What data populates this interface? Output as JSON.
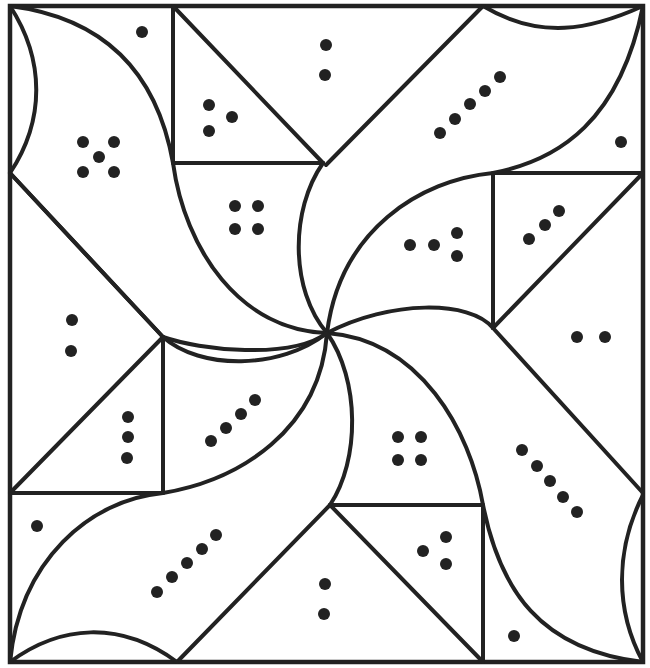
{
  "figure": {
    "type": "dot-count pinwheel puzzle (line art)",
    "width": 650,
    "height": 668,
    "stroke_color": "#222222",
    "background_color": "#ffffff",
    "frame": {
      "x1": 10,
      "y1": 6,
      "x2": 643,
      "y2": 662
    },
    "hub": {
      "x": 327,
      "y": 333
    }
  },
  "straight_lines": [
    {
      "name": "top-left-vertical",
      "x1": 173,
      "y1": 6,
      "x2": 173,
      "y2": 163
    },
    {
      "name": "top-left-horizontal",
      "x1": 173,
      "y1": 163,
      "x2": 323,
      "y2": 163
    },
    {
      "name": "top-diagonal",
      "x1": 173,
      "y1": 6,
      "x2": 323,
      "y2": 163
    },
    {
      "name": "top-right-diagonal",
      "x1": 483,
      "y1": 6,
      "x2": 326,
      "y2": 165
    },
    {
      "name": "right-upper-horizontal",
      "x1": 493,
      "y1": 173,
      "x2": 643,
      "y2": 173
    },
    {
      "name": "right-upper-vertical",
      "x1": 493,
      "y1": 173,
      "x2": 493,
      "y2": 328
    },
    {
      "name": "right-diagonal",
      "x1": 643,
      "y1": 173,
      "x2": 493,
      "y2": 328
    },
    {
      "name": "right-lower-diagonal",
      "x1": 493,
      "y1": 328,
      "x2": 643,
      "y2": 493
    },
    {
      "name": "left-diagonal",
      "x1": 10,
      "y1": 173,
      "x2": 163,
      "y2": 337
    },
    {
      "name": "left-lower-vertical",
      "x1": 163,
      "y1": 337,
      "x2": 163,
      "y2": 493
    },
    {
      "name": "left-lower-horizontal",
      "x1": 10,
      "y1": 493,
      "x2": 163,
      "y2": 493
    },
    {
      "name": "left-lower-diagonal",
      "x1": 10,
      "y1": 493,
      "x2": 163,
      "y2": 337
    },
    {
      "name": "bottom-right-horizontal",
      "x1": 330,
      "y1": 505,
      "x2": 483,
      "y2": 505
    },
    {
      "name": "bottom-right-vertical",
      "x1": 483,
      "y1": 505,
      "x2": 483,
      "y2": 662
    },
    {
      "name": "bottom-right-diagonal",
      "x1": 330,
      "y1": 505,
      "x2": 483,
      "y2": 662
    },
    {
      "name": "bottom-left-diagonal",
      "x1": 177,
      "y1": 662,
      "x2": 330,
      "y2": 505
    }
  ],
  "curves": [
    {
      "name": "top-left-blade-outer",
      "d": "M10,6 C120,20 160,90 173,163 C185,250 240,330 327,333"
    },
    {
      "name": "top-left-lens",
      "d": "M10,6 C45,60 45,120 10,173"
    },
    {
      "name": "top-left-blade-inner",
      "d": "M10,173 L163,337 C200,350 290,360 327,333"
    },
    {
      "name": "top-right-blade-outer",
      "d": "M643,6 C620,120 560,160 493,173 C420,180 340,230 327,333"
    },
    {
      "name": "top-right-lens",
      "d": "M483,6 C540,40 590,30 643,6"
    },
    {
      "name": "top-right-blade-inner",
      "d": "M323,163 C290,210 290,290 327,333"
    },
    {
      "name": "right-blade-outer",
      "d": "M643,662 C540,650 500,590 483,505 C470,430 420,340 327,333"
    },
    {
      "name": "right-lens",
      "d": "M643,495 C615,550 615,610 643,662"
    },
    {
      "name": "right-blade-inner",
      "d": "M327,333 C390,300 470,300 493,328"
    },
    {
      "name": "bottom-left-blade-outer",
      "d": "M10,662 C20,560 90,500 163,493 C240,480 320,430 327,333"
    },
    {
      "name": "bottom-lens",
      "d": "M10,662 C60,625 120,620 177,662"
    },
    {
      "name": "bottom-blade-inner",
      "d": "M327,333 C360,380 360,460 330,505"
    },
    {
      "name": "left-blade-inner",
      "d": "M163,337 C200,370 280,370 327,333"
    }
  ],
  "dot_clusters": [
    {
      "region": "top-left-corner-piece",
      "count": 1,
      "dots": [
        [
          142,
          32
        ]
      ]
    },
    {
      "region": "top-left-blade",
      "count": 5,
      "dots": [
        [
          83,
          142
        ],
        [
          114,
          142
        ],
        [
          99,
          157
        ],
        [
          83,
          172
        ],
        [
          114,
          172
        ]
      ]
    },
    {
      "region": "top-small-triangle",
      "count": 3,
      "dots": [
        [
          209,
          105
        ],
        [
          232,
          117
        ],
        [
          209,
          131
        ]
      ]
    },
    {
      "region": "top-center-triangle",
      "count": 2,
      "dots": [
        [
          326,
          45
        ],
        [
          325,
          75
        ]
      ]
    },
    {
      "region": "top-right-blade",
      "count": 5,
      "dots": [
        [
          440,
          133
        ],
        [
          455,
          119
        ],
        [
          470,
          104
        ],
        [
          485,
          91
        ],
        [
          500,
          77
        ]
      ]
    },
    {
      "region": "top-right-corner-piece",
      "count": 1,
      "dots": [
        [
          621,
          142
        ]
      ]
    },
    {
      "region": "upper-center-piece",
      "count": 4,
      "dots": [
        [
          235,
          206
        ],
        [
          258,
          206
        ],
        [
          235,
          229
        ],
        [
          258,
          229
        ]
      ]
    },
    {
      "region": "right-upper-blade-piece",
      "count": 4,
      "dots": [
        [
          410,
          245
        ],
        [
          434,
          245
        ],
        [
          457,
          233
        ],
        [
          457,
          256
        ]
      ]
    },
    {
      "region": "right-upper-triangle",
      "count": 3,
      "dots": [
        [
          529,
          239
        ],
        [
          545,
          225
        ],
        [
          559,
          211
        ]
      ]
    },
    {
      "region": "left-middle-triangle",
      "count": 2,
      "dots": [
        [
          72,
          320
        ],
        [
          71,
          351
        ]
      ]
    },
    {
      "region": "right-middle-triangle",
      "count": 2,
      "dots": [
        [
          577,
          337
        ],
        [
          605,
          337
        ]
      ]
    },
    {
      "region": "left-lower-triangle",
      "count": 3,
      "dots": [
        [
          128,
          417
        ],
        [
          128,
          437
        ],
        [
          127,
          458
        ]
      ]
    },
    {
      "region": "left-lower-blade-piece",
      "count": 4,
      "dots": [
        [
          211,
          441
        ],
        [
          226,
          428
        ],
        [
          241,
          414
        ],
        [
          255,
          400
        ]
      ]
    },
    {
      "region": "lower-center-piece",
      "count": 4,
      "dots": [
        [
          398,
          437
        ],
        [
          421,
          437
        ],
        [
          398,
          460
        ],
        [
          421,
          460
        ]
      ]
    },
    {
      "region": "right-lower-blade",
      "count": 5,
      "dots": [
        [
          522,
          450
        ],
        [
          537,
          466
        ],
        [
          550,
          481
        ],
        [
          563,
          497
        ],
        [
          577,
          512
        ]
      ]
    },
    {
      "region": "bottom-left-corner-piece",
      "count": 1,
      "dots": [
        [
          37,
          526
        ]
      ]
    },
    {
      "region": "bottom-right-small-triangle",
      "count": 3,
      "dots": [
        [
          423,
          551
        ],
        [
          446,
          537
        ],
        [
          446,
          564
        ]
      ]
    },
    {
      "region": "bottom-left-blade",
      "count": 5,
      "dots": [
        [
          157,
          592
        ],
        [
          172,
          577
        ],
        [
          187,
          563
        ],
        [
          202,
          549
        ],
        [
          216,
          535
        ]
      ]
    },
    {
      "region": "bottom-center-triangle",
      "count": 2,
      "dots": [
        [
          325,
          584
        ],
        [
          324,
          614
        ]
      ]
    },
    {
      "region": "bottom-right-corner-piece",
      "count": 1,
      "dots": [
        [
          514,
          636
        ]
      ]
    }
  ],
  "dot_radius": 6
}
